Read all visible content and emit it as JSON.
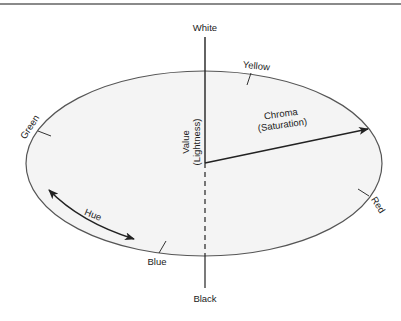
{
  "diagram": {
    "labels": {
      "white": "White",
      "black": "Black",
      "yellow": "Yellow",
      "green": "Green",
      "red": "Red",
      "blue": "Blue",
      "hue": "Hue",
      "value_line1": "Value",
      "value_line2": "(Lightness)",
      "chroma_line1": "Chroma",
      "chroma_line2": "(Saturation)"
    },
    "colors": {
      "ellipse_fill": "#f4f4f4",
      "stroke": "#333333",
      "top_rule": "#8a8a8a"
    }
  }
}
